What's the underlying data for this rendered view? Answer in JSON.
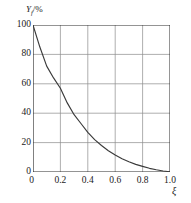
{
  "chart_data": {
    "type": "line",
    "title": "",
    "subtitle": "",
    "ylabel": "Yf/%",
    "ylabel_base": "Y",
    "ylabel_sub": "f",
    "ylabel_suffix": "/%",
    "xlabel": "ξ",
    "origin_label": "0",
    "xlim": [
      0,
      1.0
    ],
    "ylim": [
      0,
      100
    ],
    "grid": true,
    "legend": "none",
    "xticks": [
      "0.2",
      "0.4",
      "0.6",
      "0.8",
      "1.0"
    ],
    "xtick_values": [
      0.2,
      0.4,
      0.6,
      0.8,
      1.0
    ],
    "yticks": [
      "0",
      "20",
      "40",
      "60",
      "80",
      "100"
    ],
    "ytick_values": [
      0,
      20,
      40,
      60,
      80,
      100
    ],
    "series": [
      {
        "name": "Yf",
        "x": [
          0.0,
          0.05,
          0.1,
          0.15,
          0.2,
          0.25,
          0.3,
          0.35,
          0.4,
          0.45,
          0.5,
          0.55,
          0.6,
          0.65,
          0.7,
          0.75,
          0.8,
          0.85,
          0.9,
          0.95,
          1.0
        ],
        "values": [
          100.0,
          85.0,
          72.0,
          64.0,
          57.0,
          47.0,
          39.0,
          33.0,
          27.0,
          22.0,
          18.0,
          14.5,
          11.5,
          9.0,
          7.0,
          5.2,
          3.8,
          2.5,
          1.5,
          0.7,
          0.2
        ]
      }
    ],
    "curve_color": "#3a3a3a",
    "grid_color": "#8c8c8c",
    "axis_color": "#2b2b2b",
    "background_color": "#ffffff"
  }
}
